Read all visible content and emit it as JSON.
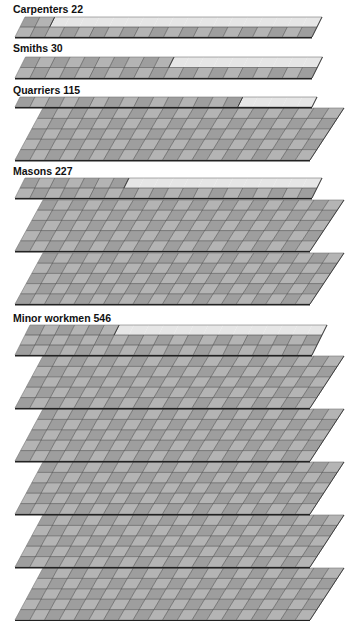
{
  "chart_data": {
    "type": "pictogram-isometric-grid",
    "title": "",
    "unit_per_cell": 1,
    "columns_per_row": 20,
    "rows_per_slab": 5,
    "categories": [
      "Carpenters",
      "Smiths",
      "Quarriers",
      "Masons",
      "Minor workmen"
    ],
    "values": [
      22,
      30,
      115,
      227,
      546
    ],
    "labels": [
      "Carpenters 22",
      "Smiths 30",
      "Quarriers 115",
      "Masons 227",
      "Minor workmen 546"
    ]
  },
  "colors": {
    "filled": "#9e9e9e",
    "filled_light": "#b4b4b4",
    "empty": "#e6e6e6",
    "grid_line": "#4a4a4a",
    "edge": "#222222"
  },
  "groups": [
    {
      "label": "Carpenters 22",
      "value": 22,
      "label_y": 3,
      "strip": {
        "top": 17,
        "bottom": 37,
        "rows": 2,
        "filled": 22
      },
      "slabs": []
    },
    {
      "label": "Smiths 30",
      "value": 30,
      "label_y": 42,
      "strip": {
        "top": 57,
        "bottom": 78,
        "rows": 2,
        "filled": 30
      },
      "slabs": []
    },
    {
      "label": "Quarriers 115",
      "value": 115,
      "label_y": 84,
      "strip": {
        "top": 97,
        "bottom": 107,
        "rows": 1,
        "filled": 15
      },
      "slabs": [
        [
          108,
          160
        ]
      ]
    },
    {
      "label": "Masons 227",
      "value": 227,
      "label_y": 165,
      "strip": {
        "top": 178,
        "bottom": 198,
        "rows": 2,
        "filled": 27
      },
      "slabs": [
        [
          200,
          251
        ],
        [
          253,
          304
        ]
      ]
    },
    {
      "label": "Minor workmen 546",
      "value": 546,
      "label_y": 312,
      "strip": {
        "top": 325,
        "bottom": 355,
        "rows": 3,
        "filled": 46
      },
      "slabs": [
        [
          356,
          408
        ],
        [
          409,
          461
        ],
        [
          462,
          514
        ],
        [
          515,
          567
        ],
        [
          568,
          620
        ]
      ]
    }
  ]
}
